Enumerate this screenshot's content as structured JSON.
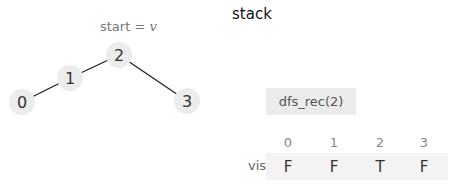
{
  "graph": {
    "start_label_prefix": "start = ",
    "start_label_var": "v",
    "nodes": [
      {
        "id": "0",
        "label": "0",
        "cx": 22,
        "cy": 102
      },
      {
        "id": "1",
        "label": "1",
        "cx": 70,
        "cy": 78
      },
      {
        "id": "2",
        "label": "2",
        "cx": 119,
        "cy": 55
      },
      {
        "id": "3",
        "label": "3",
        "cx": 187,
        "cy": 101
      }
    ],
    "edges": [
      [
        "0",
        "1"
      ],
      [
        "1",
        "2"
      ],
      [
        "2",
        "3"
      ]
    ],
    "node_fill": "#ececec",
    "edge_color": "#222222"
  },
  "stack": {
    "title": "stack",
    "frames": [
      "dfs_rec(2)"
    ]
  },
  "visited": {
    "label": "visited",
    "indices": [
      "0",
      "1",
      "2",
      "3"
    ],
    "values": [
      "F",
      "F",
      "T",
      "F"
    ]
  }
}
